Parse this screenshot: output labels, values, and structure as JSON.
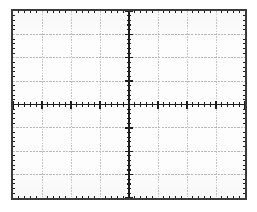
{
  "instrument": {
    "display_type": "oscilloscope-graticule",
    "screen_label": "CRT graticule"
  },
  "chart_data": {
    "type": "scatter",
    "title": "",
    "subtitle": "",
    "xlabel": "",
    "ylabel": "",
    "series": [],
    "x": [],
    "values": [],
    "categories": [],
    "grid": true,
    "legend_position": "none",
    "xlim": [
      -4,
      4
    ],
    "ylim": [
      -4,
      4
    ],
    "x_major_divisions": 8,
    "y_major_divisions": 8,
    "x_tick_labels": [],
    "y_tick_labels": [],
    "minor_ticks_per_division": 5,
    "annotations": []
  },
  "graticule": {
    "divisions_horizontal": 8,
    "divisions_vertical": 8,
    "subdivisions_per_division": 5,
    "center_x_division": 4,
    "center_y_division": 4,
    "axis_ticks_horizontal": 40,
    "axis_ticks_vertical": 40
  },
  "colors": {
    "background": "#ffffff",
    "screen_background": "#fdfdfd",
    "border": "#3a3a3a",
    "gridline": "#b9b9b9",
    "gridline_dotted": "#c4c4c4",
    "axis": "#1d1d1d",
    "tick": "#1d1d1d"
  }
}
